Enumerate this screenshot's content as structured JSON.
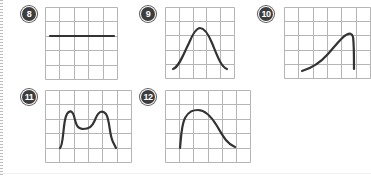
{
  "exercise_items": [
    {
      "number": "8",
      "curve_shape": "horizontal-line",
      "grid_columns": 5,
      "grid_rows": 5
    },
    {
      "number": "9",
      "curve_shape": "symmetric-bell",
      "grid_columns": 5,
      "grid_rows": 5
    },
    {
      "number": "10",
      "curve_shape": "left-skewed-peak-steep-drop",
      "grid_columns": 6,
      "grid_rows": 5
    },
    {
      "number": "11",
      "curve_shape": "bimodal",
      "grid_columns": 6,
      "grid_rows": 5
    },
    {
      "number": "12",
      "curve_shape": "right-skewed-steep-rise",
      "grid_columns": 6,
      "grid_rows": 5
    }
  ],
  "colors": {
    "grid_line": "#b5b5b5",
    "curve": "#333333",
    "badge_fill": "#3d3d3d",
    "badge_text": "#ffffff"
  }
}
